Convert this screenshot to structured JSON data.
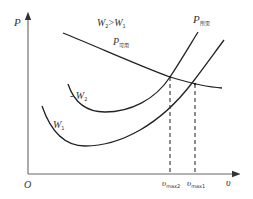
{
  "diagram": {
    "type": "power-curve-diagram",
    "axes": {
      "y_label": "P",
      "x_label": "υ",
      "origin_label": "O"
    },
    "curves": [
      {
        "id": "p_available",
        "label_main": "P",
        "label_sub": "可用",
        "description": "available power curve (decreasing)"
      },
      {
        "id": "p_required_w2",
        "label_main": "W",
        "label_sub": "2",
        "prefix": "- ",
        "description": "required power curve for weight W2"
      },
      {
        "id": "p_required_w1",
        "label_main": "W",
        "label_sub": "1",
        "description": "required power curve for weight W1"
      }
    ],
    "required_label": {
      "main": "P",
      "sub": "所需"
    },
    "condition_label": {
      "w2": "W",
      "w2_sub": "2",
      "gt": ">",
      "w1": "W",
      "w1_sub": "1"
    },
    "markers": [
      {
        "id": "vmax2",
        "main": "υ",
        "sub": "max2"
      },
      {
        "id": "vmax1",
        "main": "υ",
        "sub": "max1"
      }
    ],
    "colors": {
      "curve": "#222222",
      "axis": "#555555",
      "dashed": "#333333",
      "text": "#333333"
    }
  }
}
